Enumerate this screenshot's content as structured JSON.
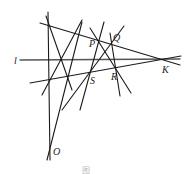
{
  "figure": {
    "labels": {
      "l": "l",
      "P": "P",
      "Q": "Q",
      "S": "S",
      "R": "R",
      "K": "K",
      "O": "O"
    },
    "caption": "图",
    "colors": {
      "line": "#1a1a1a",
      "axis_line": "#555555",
      "background": "#ffffff"
    }
  }
}
